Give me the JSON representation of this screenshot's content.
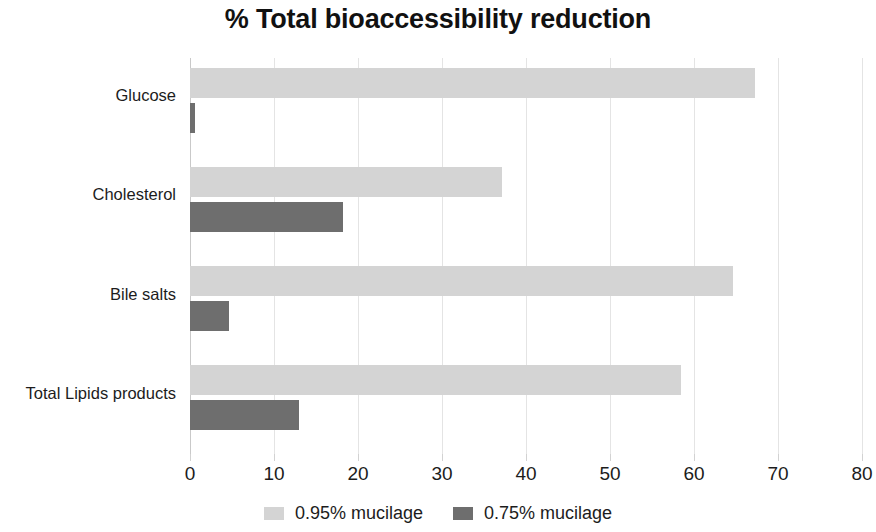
{
  "chart_data": {
    "type": "bar",
    "orientation": "horizontal",
    "title": "% Total bioaccessibility reduction",
    "xlabel": "",
    "ylabel": "",
    "xlim": [
      0,
      80
    ],
    "xticks": [
      0,
      10,
      20,
      30,
      40,
      50,
      60,
      70,
      80
    ],
    "xtick_labels": [
      "0",
      "10",
      "20",
      "30",
      "40",
      "50",
      "60",
      "70",
      "80"
    ],
    "categories": [
      "Glucose",
      "Cholesterol",
      "Bile salts",
      "Total Lipids products"
    ],
    "grid": true,
    "grid_axis": "x",
    "legend_position": "bottom",
    "series": [
      {
        "name": "0.95% mucilage",
        "color": "#d4d4d4",
        "values": [
          67.3,
          37.1,
          64.7,
          58.4
        ]
      },
      {
        "name": "0.75% mucilage",
        "color": "#6e6e6e",
        "values": [
          0.6,
          18.2,
          4.6,
          13.0
        ]
      }
    ]
  },
  "colors": {
    "series_light": "#d4d4d4",
    "series_dark": "#6e6e6e",
    "gridline": "#e4e4e4",
    "axis": "#c9c9c9",
    "text": "#1c1c1c",
    "title": "#111111",
    "background": "#ffffff"
  }
}
